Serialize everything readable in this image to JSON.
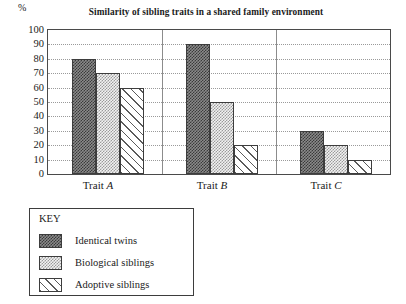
{
  "chart_data": {
    "type": "bar",
    "title": "Similarity of sibling traits in a shared family environment",
    "xlabel": "",
    "ylabel": "%",
    "ylim": [
      0,
      100
    ],
    "ytick_step": 10,
    "grid": true,
    "legend_position": "below-left",
    "legend_title": "KEY",
    "categories": [
      "Trait A",
      "Trait B",
      "Trait C"
    ],
    "yticks": [
      "100",
      "90",
      "80",
      "70",
      "60",
      "50",
      "40",
      "30",
      "20",
      "10",
      "0"
    ],
    "series": [
      {
        "name": "Identical twins",
        "pattern": "dark-checkerboard",
        "values": [
          80,
          90,
          30
        ]
      },
      {
        "name": "Biological siblings",
        "pattern": "light-dotted",
        "values": [
          70,
          50,
          20
        ]
      },
      {
        "name": "Adoptive siblings",
        "pattern": "diagonal-hatch",
        "values": [
          60,
          20,
          10
        ]
      }
    ],
    "colors": {
      "axis": "#4a4a4a",
      "gridline": "#9a9a9a",
      "identical_twins": "#3a3a3a",
      "biological_siblings": "#9b9b9b",
      "adoptive_siblings": "#5a5a5a"
    }
  }
}
